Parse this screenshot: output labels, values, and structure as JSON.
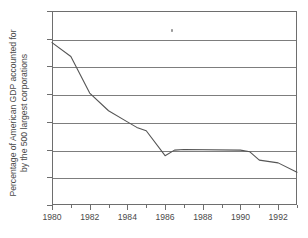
{
  "chart_data": {
    "type": "line",
    "title": "",
    "xlabel": "",
    "ylabel_line1": "Percentage of American GDP accounted for",
    "ylabel_line2": "by the 500 largest corporations",
    "xlim": [
      1980,
      1993
    ],
    "ylim": [
      30,
      65
    ],
    "yticks": [
      30,
      35,
      40,
      45,
      50,
      55,
      60,
      65
    ],
    "ytick_labels": [
      "30",
      "35",
      "40",
      "45",
      "50",
      "55",
      "60",
      "65"
    ],
    "xticks": [
      1980,
      1981,
      1982,
      1983,
      1984,
      1985,
      1986,
      1987,
      1988,
      1989,
      1990,
      1991,
      1992,
      1993
    ],
    "xtick_labels_major": [
      "1980",
      "1982",
      "1984",
      "1986",
      "1988",
      "1990",
      "1992"
    ],
    "xticks_major": [
      1980,
      1982,
      1984,
      1986,
      1988,
      1990,
      1992
    ],
    "grid": "horizontal",
    "legend": "none",
    "line_color": "#555555",
    "grid_color": "#7d7d7d",
    "axis_color": "#6e6e6e",
    "series": [
      {
        "name": "Percentage of American GDP accounted for by the 500 largest corporations",
        "x": [
          1980,
          1981,
          1982,
          1983,
          1984,
          1984.5,
          1985,
          1986,
          1986.5,
          1987,
          1990,
          1990.5,
          1991,
          1992,
          1993
        ],
        "values": [
          59.3,
          56.8,
          50.2,
          47.0,
          45.0,
          44.0,
          43.4,
          38.9,
          39.9,
          40.0,
          39.9,
          39.6,
          38.1,
          37.6,
          35.9
        ]
      }
    ]
  },
  "axis": {
    "y_title_line1": "Percentage of American GDP accounted for",
    "y_title_line2": "by the 500 largest corporations"
  }
}
